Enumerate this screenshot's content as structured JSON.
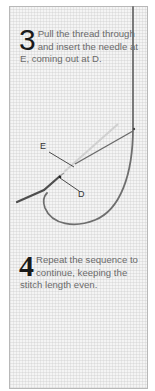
{
  "steps": [
    {
      "number": "3",
      "text": "Pull the thread through and insert the needle at E, coming out at D."
    },
    {
      "number": "4",
      "text": "Repeat the sequence to continue, keeping the stitch length even."
    }
  ],
  "diagram": {
    "labels": {
      "e": "E",
      "d": "D"
    },
    "colors": {
      "thread": "#6e6e6e",
      "needle": "#5a5a5a",
      "fabric": "#f4f4f4",
      "border": "#b8b8b8",
      "step_number": "#1a1a1a",
      "step_text": "#6a6a6a"
    }
  }
}
